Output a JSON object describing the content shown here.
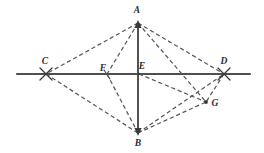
{
  "figure": {
    "type": "euclidean-construction",
    "width": 264,
    "height": 153,
    "background_color": "#ffffff",
    "stroke_color": "#3a3a3a",
    "solid_stroke_color": "#4a4a4a",
    "label_color": "#2b2b2b"
  },
  "points": [
    {
      "id": "A",
      "label": "A",
      "x": 138,
      "y": 23,
      "label_x": 137,
      "label_y": 11,
      "marker": "vertex"
    },
    {
      "id": "C",
      "label": "C",
      "x": 46,
      "y": 74,
      "label_x": 45,
      "label_y": 62,
      "marker": "cross"
    },
    {
      "id": "F",
      "label": "F",
      "x": 107,
      "y": 74,
      "label_x": 103,
      "label_y": 69,
      "marker": "tick"
    },
    {
      "id": "E",
      "label": "E",
      "x": 139,
      "y": 74,
      "label_x": 142,
      "label_y": 67,
      "marker": "intersection"
    },
    {
      "id": "D",
      "label": "D",
      "x": 224,
      "y": 74,
      "label_x": 224,
      "label_y": 62,
      "marker": "cross"
    },
    {
      "id": "G",
      "label": "G",
      "x": 206,
      "y": 102,
      "label_x": 215,
      "label_y": 104,
      "marker": "dot"
    },
    {
      "id": "B",
      "label": "B",
      "x": 138,
      "y": 133,
      "label_x": 138,
      "label_y": 144,
      "marker": "vertex"
    }
  ],
  "solid_segments": [
    {
      "id": "baseline",
      "from": "line-left-end",
      "to": "line-right-end",
      "x1": 17,
      "y1": 74,
      "x2": 250,
      "y2": 74,
      "style": "solid"
    },
    {
      "id": "AB",
      "from": "A",
      "to": "B",
      "x1": 138,
      "y1": 23,
      "x2": 138,
      "y2": 133,
      "style": "solid"
    }
  ],
  "dashed_segments": [
    {
      "id": "AC",
      "from": "A",
      "to": "C",
      "x1": 138,
      "y1": 23,
      "x2": 46,
      "y2": 74
    },
    {
      "id": "AF",
      "from": "A",
      "to": "F",
      "x1": 138,
      "y1": 23,
      "x2": 107,
      "y2": 74
    },
    {
      "id": "AD",
      "from": "A",
      "to": "D",
      "x1": 138,
      "y1": 23,
      "x2": 224,
      "y2": 74
    },
    {
      "id": "AG",
      "from": "A",
      "to": "G",
      "x1": 138,
      "y1": 23,
      "x2": 206,
      "y2": 102
    },
    {
      "id": "CB",
      "from": "C",
      "to": "B",
      "x1": 46,
      "y1": 74,
      "x2": 138,
      "y2": 133
    },
    {
      "id": "FB",
      "from": "F",
      "to": "B",
      "x1": 107,
      "y1": 74,
      "x2": 138,
      "y2": 133
    },
    {
      "id": "EG",
      "from": "E",
      "to": "G",
      "x1": 139,
      "y1": 74,
      "x2": 206,
      "y2": 102
    },
    {
      "id": "BD",
      "from": "B",
      "to": "D",
      "x1": 138,
      "y1": 133,
      "x2": 224,
      "y2": 74
    },
    {
      "id": "BG",
      "from": "B",
      "to": "G",
      "x1": 138,
      "y1": 133,
      "x2": 206,
      "y2": 102
    },
    {
      "id": "DG",
      "from": "D",
      "to": "G",
      "x1": 224,
      "y1": 74,
      "x2": 206,
      "y2": 102
    }
  ],
  "arrow_markers": [
    {
      "id": "arrow-at-A",
      "at": "A",
      "direction": "up"
    },
    {
      "id": "arrow-at-B",
      "at": "B",
      "direction": "down"
    }
  ]
}
